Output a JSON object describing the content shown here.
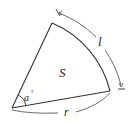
{
  "diagram": {
    "type": "sector",
    "labels": {
      "area": "S",
      "angle": "a",
      "angle_unit": "°",
      "arc_length": "l",
      "radius": "r"
    },
    "colors": {
      "stroke": "#333333",
      "background": "#ffffff",
      "text": "#222222"
    }
  }
}
